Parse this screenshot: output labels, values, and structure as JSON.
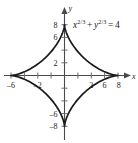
{
  "figure": {
    "name": "astroid-graph",
    "background_color": "#ffffff",
    "curve_color": "#1a1a1a",
    "axis_color": "#4a4a4a",
    "equation": {
      "full_text": "x^{2/3} + y^{2/3} = 4",
      "lhs_var1": "x",
      "exp1": "2/3",
      "operator": "+",
      "lhs_var2": "y",
      "exp2": "2/3",
      "equals": "=",
      "rhs": "4"
    },
    "x_axis_label": "x",
    "y_axis_label": "y",
    "x_tick_labels": [
      "–6",
      "–2",
      "2",
      "6",
      "8"
    ],
    "y_tick_labels": [
      "8",
      "6",
      "2",
      "–6",
      "–8"
    ]
  },
  "chart_data": {
    "type": "line",
    "title": "",
    "subtitle": "",
    "xlabel": "x",
    "ylabel": "y",
    "annotations": [
      "x^{2/3} + y^{2/3} = 4"
    ],
    "legend": [],
    "legend_position": "none",
    "grid": false,
    "xlim": [
      -10,
      10
    ],
    "ylim": [
      -10,
      10
    ],
    "x_ticks": [
      -8,
      -6,
      -4,
      -2,
      2,
      4,
      6,
      8
    ],
    "x_ticklabels_shown": {
      "-6": "–6",
      "-2": "–2",
      "2": "2",
      "6": "6",
      "8": "8"
    },
    "y_ticks": [
      -8,
      -6,
      -4,
      -2,
      2,
      4,
      6,
      8
    ],
    "y_ticklabels_shown": {
      "8": "8",
      "6": "6",
      "2": "2",
      "-6": "–6",
      "-8": "–8"
    },
    "curve_name": "astroid",
    "equation": "x^(2/3) + y^(2/3) = 4",
    "parametric": "x = 8*cos^3(t), y = 8*sin^3(t)",
    "cusps": [
      [
        8,
        0
      ],
      [
        0,
        8
      ],
      [
        -8,
        0
      ],
      [
        0,
        -8
      ]
    ],
    "series": [
      {
        "name": "astroid",
        "x": [
          8,
          7.71,
          6.91,
          5.73,
          4.36,
          3.0,
          1.8,
          0.87,
          0.25,
          0,
          -0.25,
          -0.87,
          -1.8,
          -3.0,
          -4.36,
          -5.73,
          -6.91,
          -7.71,
          -8,
          -7.71,
          -6.91,
          -5.73,
          -4.36,
          -3.0,
          -1.8,
          -0.87,
          -0.25,
          0,
          0.25,
          0.87,
          1.8,
          3.0,
          4.36,
          5.73,
          6.91,
          7.71,
          8
        ],
        "y": [
          0,
          0.25,
          0.87,
          1.8,
          3.0,
          4.36,
          5.73,
          6.91,
          7.71,
          8,
          7.71,
          6.91,
          5.73,
          4.36,
          3.0,
          1.8,
          0.87,
          0.25,
          0,
          -0.25,
          -0.87,
          -1.8,
          -3.0,
          -4.36,
          -5.73,
          -6.91,
          -7.71,
          -8,
          -7.71,
          -6.91,
          -5.73,
          -4.36,
          -3.0,
          -1.8,
          -0.87,
          -0.25,
          0
        ]
      }
    ]
  }
}
